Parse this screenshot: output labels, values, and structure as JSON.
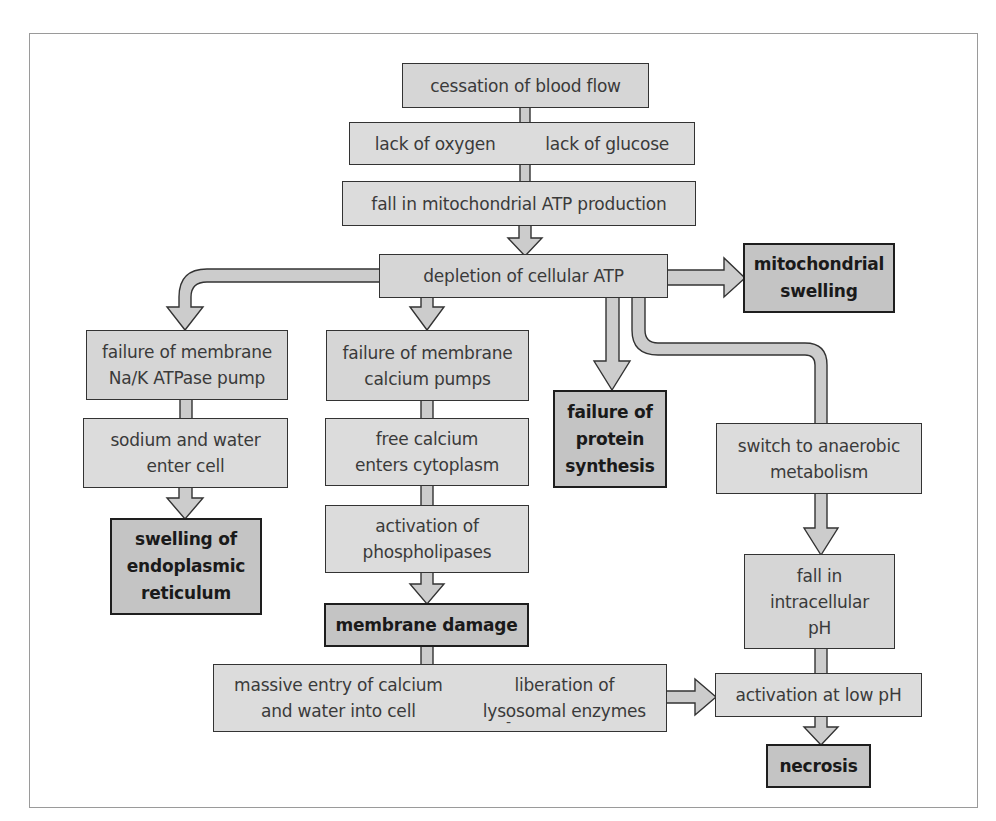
{
  "diagram": {
    "title": "",
    "colors": {
      "box_fill": "#d6d6d6",
      "outcome_fill": "#c4c4c4",
      "arrow_fill": "#cccccc",
      "stroke": "#333333",
      "frame": "#9a9a9a"
    },
    "nodes": {
      "cessation": {
        "lines": [
          "cessation of blood flow"
        ],
        "type": "process"
      },
      "lack": {
        "left": [
          "lack of oxygen"
        ],
        "right": [
          "lack of glucose"
        ],
        "type": "process"
      },
      "fall_atp": {
        "lines": [
          "fall in mitochondrial ATP production"
        ],
        "type": "process"
      },
      "depletion": {
        "lines": [
          "depletion of cellular ATP"
        ],
        "type": "process"
      },
      "mito_swelling": {
        "lines": [
          "mitochondrial",
          "swelling"
        ],
        "type": "outcome"
      },
      "nak_failure": {
        "lines": [
          "failure of membrane",
          "Na/K ATPase pump"
        ],
        "type": "process"
      },
      "sodium_water": {
        "lines": [
          "sodium and water",
          "enter cell"
        ],
        "type": "process"
      },
      "er_swelling": {
        "lines": [
          "swelling of",
          "endoplasmic",
          "reticulum"
        ],
        "type": "outcome"
      },
      "ca_failure": {
        "lines": [
          "failure of membrane",
          "calcium pumps"
        ],
        "type": "process"
      },
      "free_calcium": {
        "lines": [
          "free calcium",
          "enters cytoplasm"
        ],
        "type": "process"
      },
      "phospholipases": {
        "lines": [
          "activation of",
          "phospholipases"
        ],
        "type": "process"
      },
      "membrane_damage": {
        "lines": [
          "membrane damage"
        ],
        "type": "outcome"
      },
      "massive": {
        "left": [
          "massive entry of calcium",
          "and water into cell"
        ],
        "separator": "-",
        "right": [
          "liberation of",
          "lysosomal enzymes"
        ],
        "type": "process"
      },
      "protein_failure": {
        "lines": [
          "failure of",
          "protein",
          "synthesis"
        ],
        "type": "outcome"
      },
      "anaerobic": {
        "lines": [
          "switch to anaerobic",
          "metabolism"
        ],
        "type": "process"
      },
      "fall_ph": {
        "lines": [
          "fall in",
          "intracellular",
          "pH"
        ],
        "type": "process"
      },
      "low_ph": {
        "lines": [
          "activation at low pH"
        ],
        "type": "process"
      },
      "necrosis": {
        "lines": [
          "necrosis"
        ],
        "type": "outcome"
      }
    },
    "edges": [
      [
        "cessation",
        "lack"
      ],
      [
        "lack",
        "fall_atp"
      ],
      [
        "fall_atp",
        "depletion"
      ],
      [
        "depletion",
        "mito_swelling"
      ],
      [
        "depletion",
        "nak_failure"
      ],
      [
        "depletion",
        "ca_failure"
      ],
      [
        "depletion",
        "protein_failure"
      ],
      [
        "depletion",
        "anaerobic"
      ],
      [
        "nak_failure",
        "sodium_water"
      ],
      [
        "sodium_water",
        "er_swelling"
      ],
      [
        "ca_failure",
        "free_calcium"
      ],
      [
        "free_calcium",
        "phospholipases"
      ],
      [
        "phospholipases",
        "membrane_damage"
      ],
      [
        "membrane_damage",
        "massive"
      ],
      [
        "massive",
        "low_ph"
      ],
      [
        "anaerobic",
        "fall_ph"
      ],
      [
        "fall_ph",
        "low_ph"
      ],
      [
        "low_ph",
        "necrosis"
      ]
    ]
  }
}
